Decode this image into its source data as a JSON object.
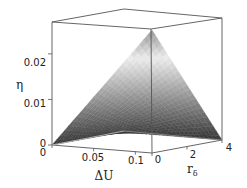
{
  "chart_data": {
    "type": "surface3d",
    "title": "",
    "x_axis": {
      "label": "ΔU",
      "range": [
        0,
        0.12
      ],
      "ticks": [
        0,
        0.05,
        0.1
      ],
      "tick_labels": [
        "0",
        "0.05",
        "0.1"
      ]
    },
    "y_axis": {
      "label": "r",
      "label_subscript": "δ",
      "range": [
        0,
        4
      ],
      "ticks": [
        0,
        2,
        4
      ],
      "tick_labels": [
        "0",
        "2",
        "4"
      ]
    },
    "z_axis": {
      "label": "η",
      "range": [
        0,
        0.027
      ],
      "ticks": [
        0,
        0.01,
        0.02
      ],
      "tick_labels": [
        "0",
        "0.01",
        "0.02"
      ]
    },
    "surface_description": "η increases roughly linearly with ΔU and decreases as r_δ increases; peak near ΔU=0.12, r_δ=0; surface shaded grayscale from dark (low η) to light (high η)",
    "surface_samples": [
      {
        "dU": 0.0,
        "r": 0,
        "eta": 0.0
      },
      {
        "dU": 0.12,
        "r": 0,
        "eta": 0.027
      },
      {
        "dU": 0.12,
        "r": 4,
        "eta": 0.0
      },
      {
        "dU": 0.0,
        "r": 4,
        "eta": 0.0
      }
    ],
    "grid": false,
    "box": true,
    "colormap": "grayscale"
  }
}
